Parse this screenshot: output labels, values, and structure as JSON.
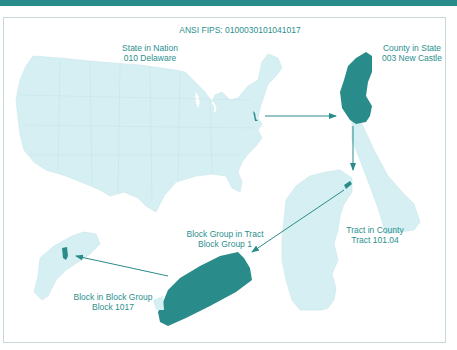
{
  "header": {
    "title": "ANSI FIPS: 0100030101041017"
  },
  "colors": {
    "accent": "#2a8c8a",
    "highlight": "#2a8c8a",
    "map_fill": "#d6eff2",
    "label_text": "#2b8f8e",
    "frame_border": "#c9d9d9"
  },
  "levels": [
    {
      "id": "state",
      "title": "State in Nation",
      "value": "010 Delaware"
    },
    {
      "id": "county",
      "title": "County in State",
      "value": "003 New Castle"
    },
    {
      "id": "tract",
      "title": "Tract in County",
      "value": "Tract 101.04"
    },
    {
      "id": "block_group",
      "title": "Block Group in Tract",
      "value": "Block Group 1"
    },
    {
      "id": "block",
      "title": "Block in Block Group",
      "value": "Block 1017"
    }
  ]
}
